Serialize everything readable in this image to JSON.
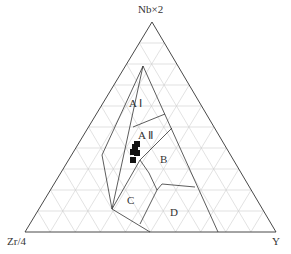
{
  "diagram": {
    "type": "ternary",
    "vertices": {
      "top": "Nb×2",
      "left": "Zr/4",
      "right": "Y"
    },
    "regions": [
      {
        "id": "AI",
        "label": "A Ⅰ"
      },
      {
        "id": "AII",
        "label": "A Ⅱ"
      },
      {
        "id": "B",
        "label": "B"
      },
      {
        "id": "C",
        "label": "C"
      },
      {
        "id": "D",
        "label": "D"
      }
    ],
    "grid_divisions": 10,
    "samples": [
      {
        "x": 137,
        "y": 144
      },
      {
        "x": 135,
        "y": 147
      },
      {
        "x": 133,
        "y": 152
      },
      {
        "x": 137,
        "y": 153
      },
      {
        "x": 133,
        "y": 160
      }
    ],
    "colors": {
      "outline": "#333333",
      "grid": "#cccccc",
      "marker": "#111111"
    }
  }
}
